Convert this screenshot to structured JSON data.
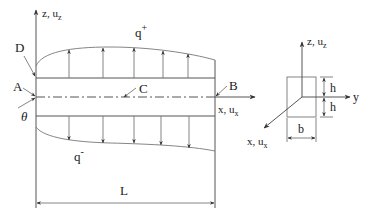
{
  "figure": {
    "type": "beam-loading-diagram",
    "beam": {
      "points": {
        "A": "A",
        "B": "B",
        "C": "C",
        "D": "D"
      },
      "angle_label": "θ",
      "axes": {
        "vertical": "z, u",
        "vertical_sub": "z",
        "horizontal": "x, u",
        "horizontal_sub": "x"
      },
      "loads": {
        "top": "q",
        "top_sup": "+",
        "bottom": "q",
        "bottom_sup": "-"
      },
      "length_label": "L"
    },
    "cross_section": {
      "axes": {
        "z": "z, u",
        "z_sub": "z",
        "y": "y",
        "x": "x, u",
        "x_sub": "x"
      },
      "height_upper": "h",
      "height_lower": "h",
      "width": "b"
    }
  }
}
